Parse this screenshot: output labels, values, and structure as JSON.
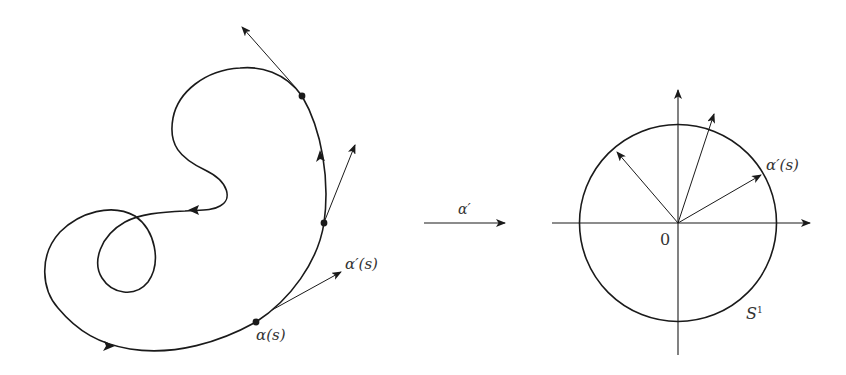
{
  "figure": {
    "left_panel": {
      "description": "plane curve alpha(s) with tangent vectors",
      "point_label": "α(s)",
      "tangent_label": "α′(s)"
    },
    "map": {
      "label": "α′"
    },
    "right_panel": {
      "description": "unit circle with tangent indicatrix vectors",
      "origin_label": "0",
      "vector_label": "α′(s)",
      "circle_label": "S",
      "circle_label_sup": "1"
    },
    "colors": {
      "stroke": "#1a1a1a",
      "text": "#333333",
      "background": "#ffffff"
    }
  }
}
